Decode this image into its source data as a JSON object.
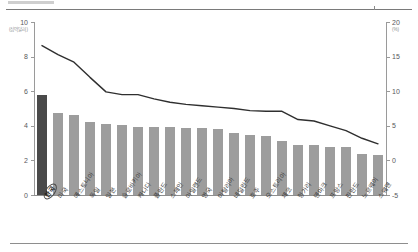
{
  "chart_data": {
    "type": "bar",
    "title": "",
    "subtitle": "",
    "xlabel": "",
    "ylabel": "",
    "grid": false,
    "legend_position": "none",
    "left_axis": {
      "unit": "(십억달러)",
      "ticks": [
        "10",
        "8",
        "6",
        "4",
        "2",
        "0"
      ],
      "tick_values": [
        10,
        8,
        6,
        4,
        2,
        0
      ],
      "ylim": [
        0,
        10
      ]
    },
    "right_axis": {
      "unit": "(%)",
      "ticks": [
        "20",
        "15",
        "10",
        "5",
        "0",
        "-5"
      ],
      "tick_values": [
        20,
        15,
        10,
        5,
        0,
        -5
      ],
      "ylim": [
        -5,
        20
      ]
    },
    "categories": [
      "한국",
      "미국",
      "에스토니아",
      "독일",
      "일본",
      "슬로바키아",
      "캐나다",
      "폴란드",
      "스페인",
      "아일랜드",
      "영국",
      "이탈리아",
      "네덜란드",
      "호주",
      "오스트리아",
      "체코",
      "헝가리",
      "덴마크",
      "프랑스",
      "핀란드",
      "노르웨이",
      "스웨덴"
    ],
    "highlight_category": "한국",
    "series": [
      {
        "name": "bars",
        "axis": "left",
        "type": "bar",
        "color": "#9d9d9d",
        "highlight_color": "#4a4a4a",
        "values": [
          5.8,
          4.75,
          4.6,
          4.2,
          4.1,
          4.05,
          3.95,
          3.95,
          3.95,
          3.9,
          3.85,
          3.8,
          3.6,
          3.45,
          3.4,
          3.1,
          2.9,
          2.9,
          2.8,
          2.75,
          2.35,
          2.3
        ]
      },
      {
        "name": "line",
        "axis": "right",
        "type": "line",
        "color": "#2f2f2f",
        "values": [
          16.6,
          15.3,
          14.2,
          12.0,
          9.9,
          9.5,
          9.5,
          8.9,
          8.4,
          8.1,
          7.9,
          7.7,
          7.5,
          7.2,
          7.1,
          7.1,
          5.9,
          5.7,
          5.0,
          4.3,
          3.2,
          2.4
        ]
      }
    ]
  }
}
